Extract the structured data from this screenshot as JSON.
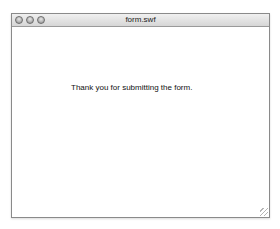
{
  "window": {
    "title": "form.swf",
    "buttons": [
      "close",
      "minimize",
      "zoom"
    ]
  },
  "content": {
    "message": "Thank you for submitting the form."
  }
}
